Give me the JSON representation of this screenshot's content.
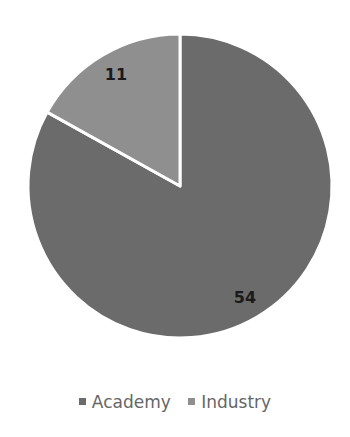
{
  "chart_data": {
    "type": "pie",
    "title": "",
    "categories": [
      "Academy",
      "Industry"
    ],
    "values": [
      54,
      11
    ],
    "colors": [
      "#6b6b6b",
      "#8f8f8f"
    ],
    "data_labels": [
      "54",
      "11"
    ],
    "start_angle_deg": 0,
    "legend_position": "bottom"
  },
  "legend": {
    "items": [
      {
        "label": "Academy",
        "color": "#6b6b6b"
      },
      {
        "label": "Industry",
        "color": "#8f8f8f"
      }
    ]
  }
}
